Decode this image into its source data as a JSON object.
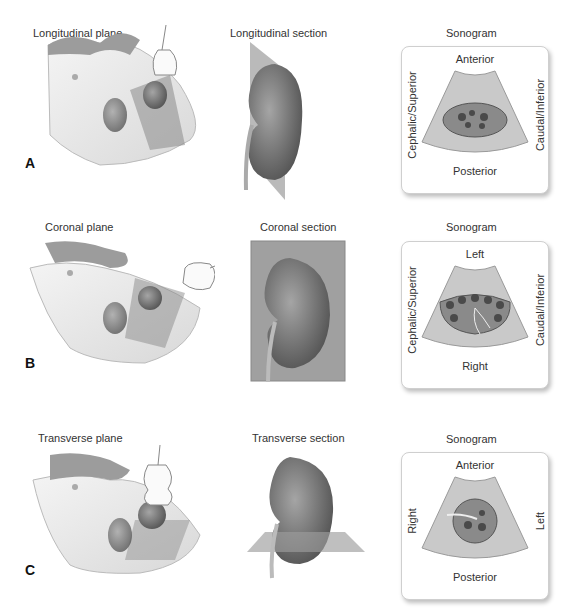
{
  "figure": {
    "rows": [
      {
        "letter": "A",
        "plane_label": "Longitudinal plane",
        "section_label": "Longitudinal section",
        "sonogram": {
          "title": "Sonogram",
          "top": "Anterior",
          "bottom": "Posterior",
          "left": "Cephalic/Superior",
          "right": "Caudal/Inferior"
        }
      },
      {
        "letter": "B",
        "plane_label": "Coronal plane",
        "section_label": "Coronal section",
        "sonogram": {
          "title": "Sonogram",
          "top": "Left",
          "bottom": "Right",
          "left": "Cephalic/Superior",
          "right": "Caudal/Inferior"
        }
      },
      {
        "letter": "C",
        "plane_label": "Transverse plane",
        "section_label": "Transverse section",
        "sonogram": {
          "title": "Sonogram",
          "top": "Anterior",
          "bottom": "Posterior",
          "left": "Right",
          "right": "Left"
        }
      }
    ]
  },
  "colors": {
    "skin": "#e6e6e6",
    "kidney_dark": "#5a5a5a",
    "kidney_light": "#9a9a9a",
    "plane": "#9d9d9d",
    "sono_fill": "#c9c9c9"
  }
}
